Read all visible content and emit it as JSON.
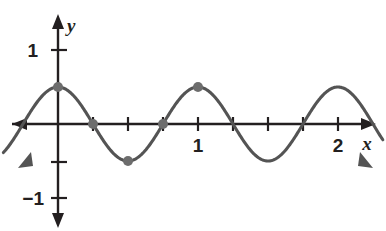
{
  "figure": {
    "kind": "cartesian-graph",
    "background_color": "#ffffff",
    "axis_color": "#231f20",
    "curve_color": "#545454",
    "point_color": "#6d6d6d"
  },
  "axes": {
    "x_axis": {
      "label": "x",
      "tick_values": [
        0.25,
        0.5,
        0.75,
        1,
        1.25,
        1.5,
        1.75,
        2
      ],
      "labeled_ticks": [
        {
          "value": 1,
          "text": "1"
        },
        {
          "value": 2,
          "text": "2"
        }
      ],
      "range": [
        -0.42,
        2.36
      ],
      "arrows": [
        "left",
        "right"
      ]
    },
    "y_axis": {
      "label": "y",
      "tick_values": [
        1,
        0.5,
        -0.5,
        -1
      ],
      "labeled_ticks": [
        {
          "value": 1,
          "text": "1"
        },
        {
          "value": -1,
          "text": "−1"
        }
      ],
      "range": [
        -1.4,
        1.24
      ],
      "arrows": [
        "up",
        "down"
      ]
    },
    "grid": "off",
    "origin_label": ""
  },
  "chart_data": {
    "type": "line",
    "title": "",
    "xlabel": "x",
    "ylabel": "y",
    "xlim": [
      -0.42,
      2.36
    ],
    "ylim": [
      -1.4,
      1.24
    ],
    "grid": false,
    "legend": "none",
    "series": [
      {
        "name": "y = 0.5 cos(2πx)",
        "amplitude": 0.5,
        "period": 1,
        "phase": 0,
        "midline": 0,
        "function": "0.5*cos(2*pi*x)",
        "x": [
          -0.42,
          -0.4,
          -0.35,
          -0.3,
          -0.25,
          -0.2,
          -0.15,
          -0.1,
          -0.05,
          0,
          0.05,
          0.1,
          0.15,
          0.2,
          0.25,
          0.3,
          0.35,
          0.4,
          0.45,
          0.5,
          0.55,
          0.6,
          0.65,
          0.7,
          0.75,
          0.8,
          0.85,
          0.9,
          0.95,
          1,
          1.05,
          1.1,
          1.15,
          1.2,
          1.25,
          1.3,
          1.35,
          1.4,
          1.45,
          1.5,
          1.55,
          1.6,
          1.65,
          1.7,
          1.75,
          1.8,
          1.85,
          1.9,
          1.95,
          2,
          2.05,
          2.1,
          2.15,
          2.2,
          2.25,
          2.3,
          2.36
        ],
        "y": [
          -0.44,
          -0.4,
          -0.22,
          0.0,
          0.22,
          0.4,
          0.48,
          0.48,
          0.4,
          0.5,
          0.4,
          0.4,
          0.22,
          0.0,
          0.0,
          -0.22,
          -0.4,
          -0.48,
          -0.48,
          -0.5,
          -0.48,
          -0.4,
          -0.22,
          0.0,
          0.0,
          0.22,
          0.4,
          0.48,
          0.48,
          0.5,
          0.48,
          0.4,
          0.22,
          0.0,
          0.0,
          -0.22,
          -0.4,
          -0.48,
          -0.48,
          -0.5,
          -0.48,
          -0.4,
          -0.22,
          0.0,
          0.0,
          0.22,
          0.4,
          0.48,
          0.48,
          0.5,
          0.48,
          0.4,
          0.22,
          0.0,
          0.0,
          -0.22,
          -0.44
        ]
      }
    ],
    "marked_points": [
      {
        "x": 0,
        "y": 0.5,
        "role": "maximum-y-intercept"
      },
      {
        "x": 0.25,
        "y": 0,
        "role": "x-intercept"
      },
      {
        "x": 0.5,
        "y": -0.5,
        "role": "minimum"
      },
      {
        "x": 0.75,
        "y": 0,
        "role": "x-intercept"
      },
      {
        "x": 1,
        "y": 0.5,
        "role": "maximum"
      }
    ],
    "curve_end_arrows": [
      "down-left",
      "down-right"
    ]
  }
}
